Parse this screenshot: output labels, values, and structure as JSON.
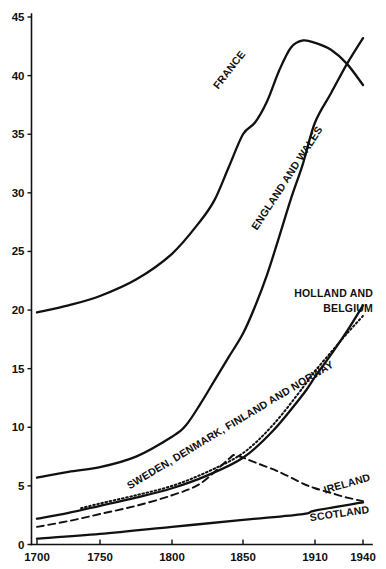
{
  "chart_data": {
    "type": "line",
    "title": "",
    "subtitle": "",
    "xlabel": "",
    "ylabel": "",
    "xlim": [
      1700,
      1940
    ],
    "ylim": [
      0,
      45
    ],
    "grid": false,
    "legend": "inline-labels",
    "x_ticks": [
      "1700",
      "1750",
      "1800",
      "1850",
      "1910",
      "1940"
    ],
    "x_tick_values": [
      1700,
      1750,
      1800,
      1850,
      1910,
      1940
    ],
    "y_ticks": [
      "0",
      "5",
      "10",
      "15",
      "20",
      "25",
      "30",
      "35",
      "40",
      "45"
    ],
    "y_tick_values": [
      0,
      5,
      10,
      15,
      20,
      25,
      30,
      35,
      40,
      45
    ],
    "series": [
      {
        "name": "FRANCE",
        "style": "solid",
        "x": [
          1700,
          1725,
          1750,
          1775,
          1800,
          1820,
          1830,
          1840,
          1850,
          1860,
          1870,
          1880,
          1890,
          1900,
          1910,
          1920,
          1930,
          1940
        ],
        "values": [
          19.8,
          20.4,
          21.2,
          22.6,
          24.8,
          27.6,
          29.4,
          32.2,
          35.0,
          36.0,
          37.8,
          40.4,
          42.4,
          43.0,
          42.8,
          42.2,
          41.0,
          39.2
        ]
      },
      {
        "name": "ENGLAND AND WALES",
        "style": "solid",
        "x": [
          1700,
          1725,
          1750,
          1775,
          1800,
          1810,
          1820,
          1830,
          1840,
          1850,
          1860,
          1870,
          1880,
          1890,
          1900,
          1910,
          1920,
          1930,
          1940
        ],
        "values": [
          5.7,
          6.2,
          6.6,
          7.5,
          9.2,
          10.2,
          12.0,
          14.0,
          16.0,
          18.0,
          20.3,
          23.0,
          26.2,
          29.5,
          32.5,
          36.0,
          38.5,
          41.0,
          43.2
        ]
      },
      {
        "name": "HOLLAND AND BELGIUM",
        "style": "dotted",
        "x": [
          1735,
          1750,
          1775,
          1800,
          1825,
          1850,
          1875,
          1900,
          1910,
          1920,
          1930,
          1940
        ],
        "values": [
          3.1,
          3.5,
          4.2,
          5.0,
          6.2,
          7.8,
          10.2,
          13.4,
          14.8,
          16.4,
          18.0,
          19.5
        ]
      },
      {
        "name": "SWEDEN, DENMARK, FINLAND AND NORWAY",
        "style": "solid",
        "x": [
          1700,
          1725,
          1750,
          1775,
          1800,
          1825,
          1850,
          1875,
          1900,
          1910,
          1920,
          1930,
          1940
        ],
        "values": [
          2.2,
          2.7,
          3.3,
          4.0,
          4.8,
          5.9,
          7.4,
          9.7,
          12.8,
          14.3,
          16.2,
          18.2,
          20.4
        ]
      },
      {
        "name": "IRELAND",
        "style": "dashed",
        "x": [
          1700,
          1725,
          1750,
          1775,
          1800,
          1820,
          1840,
          1845,
          1860,
          1880,
          1900,
          1910,
          1920,
          1930,
          1940
        ],
        "values": [
          1.5,
          2.0,
          2.6,
          3.3,
          4.2,
          5.2,
          7.3,
          7.6,
          7.0,
          6.2,
          5.2,
          4.8,
          4.4,
          4.0,
          3.7
        ]
      },
      {
        "name": "SCOTLAND",
        "style": "solid",
        "x": [
          1700,
          1750,
          1800,
          1850,
          1900,
          1910,
          1940
        ],
        "values": [
          0.5,
          0.9,
          1.5,
          2.1,
          2.6,
          2.9,
          3.6
        ]
      }
    ],
    "annotations": [
      {
        "text": "FRANCE",
        "rotation": -52
      },
      {
        "text": "ENGLAND AND WALES",
        "rotation": -57
      },
      {
        "text": "HOLLAND AND",
        "rotation": 0
      },
      {
        "text": "BELGIUM",
        "rotation": 0
      },
      {
        "text": "SWEDEN, DENMARK, FINLAND AND NORWAY",
        "rotation": -31
      },
      {
        "text": "IRELAND",
        "rotation": -17
      },
      {
        "text": "SCOTLAND",
        "rotation": -9
      }
    ]
  },
  "labels": {
    "france": "FRANCE",
    "england_wales": "ENGLAND AND WALES",
    "holland_line1": "HOLLAND AND",
    "holland_line2": "BELGIUM",
    "nordic": "SWEDEN, DENMARK, FINLAND AND NORWAY",
    "ireland": "IRELAND",
    "scotland": "SCOTLAND"
  },
  "axes": {
    "y_ticks": [
      "45",
      "40",
      "35",
      "30",
      "25",
      "20",
      "15",
      "10",
      "5",
      "0"
    ],
    "x_ticks": [
      "1700",
      "1750",
      "1800",
      "1850",
      "1910",
      "1940"
    ]
  },
  "colors": {
    "ink": "#111111",
    "background": "#ffffff"
  }
}
